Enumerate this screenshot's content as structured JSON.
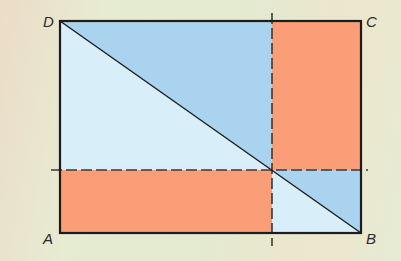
{
  "diagram": {
    "type": "geometry-rectangle-diagonal-partition",
    "vertices": {
      "A": {
        "label": "A",
        "x": 60,
        "y": 233
      },
      "B": {
        "label": "B",
        "x": 361,
        "y": 233
      },
      "C": {
        "label": "C",
        "x": 361,
        "y": 21
      },
      "D": {
        "label": "D",
        "x": 60,
        "y": 21
      }
    },
    "split_point": {
      "x": 272,
      "y": 170
    },
    "diagonal": {
      "from": "D",
      "to": "B"
    },
    "dashed_lines": [
      {
        "orientation": "vertical",
        "x": 272,
        "y1": 13,
        "y2": 246
      },
      {
        "orientation": "horizontal",
        "y": 170,
        "x1": 51,
        "x2": 368
      }
    ],
    "colors": {
      "mid_blue": "#a9d3ef",
      "light_blue": "#d8eef9",
      "orange": "#f99e76",
      "stroke": "#1c1c1c",
      "dash": "#3a3a3a"
    },
    "regions": [
      {
        "name": "top-left-upper-triangle",
        "fill": "mid_blue"
      },
      {
        "name": "top-left-lower-triangle",
        "fill": "light_blue"
      },
      {
        "name": "top-right-rectangle",
        "fill": "orange"
      },
      {
        "name": "bottom-left-rectangle",
        "fill": "orange"
      },
      {
        "name": "bottom-right-upper-triangle",
        "fill": "mid_blue"
      },
      {
        "name": "bottom-right-lower-triangle",
        "fill": "light_blue"
      }
    ]
  }
}
